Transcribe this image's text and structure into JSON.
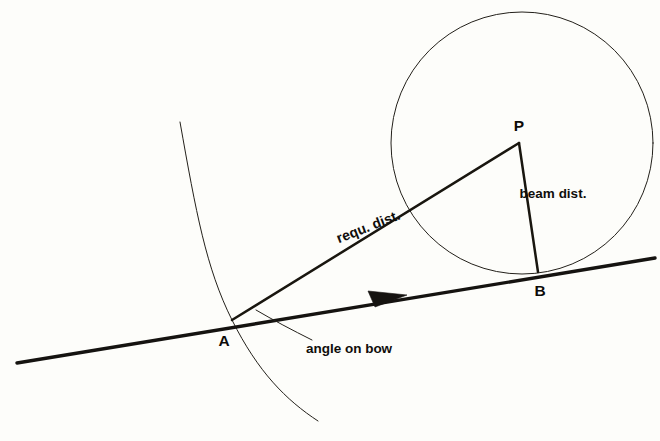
{
  "diagram": {
    "background_color": "#fdfdfa",
    "ink_color": "#151310",
    "points": [
      {
        "id": "A",
        "label": "A",
        "x": 232,
        "y": 320,
        "label_x": 222,
        "label_y": 344,
        "role": "own-ship position"
      },
      {
        "id": "B",
        "label": "B",
        "x": 538,
        "y": 272,
        "label_x": 538,
        "label_y": 295,
        "role": "beam point"
      },
      {
        "id": "P",
        "label": "P",
        "x": 519,
        "y": 143,
        "label_x": 519,
        "label_y": 129,
        "role": "target centre"
      }
    ],
    "labels": {
      "requ_dist": "requ. dist.",
      "beam_dist": "beam dist.",
      "angle_on_bow": "angle on bow"
    },
    "label_positions": {
      "requ_dist": {
        "x": 370,
        "y": 232,
        "rotation": -21.5
      },
      "beam_dist": {
        "x": 553,
        "y": 196,
        "rotation": 0
      },
      "angle_on_bow": {
        "x": 295,
        "y": 352,
        "rotation": 0
      }
    },
    "elements": [
      {
        "name": "bearing-line",
        "type": "line",
        "from": [
          17,
          363
        ],
        "to": [
          655,
          258
        ]
      },
      {
        "name": "direction-arrowhead",
        "type": "arrow",
        "tip": [
          407,
          296
        ]
      },
      {
        "name": "requ-dist-line",
        "type": "line",
        "from": [
          232,
          320
        ],
        "to": [
          519,
          143
        ]
      },
      {
        "name": "beam-dist-line",
        "type": "line",
        "from": [
          519,
          143
        ],
        "to": [
          538,
          272
        ]
      },
      {
        "name": "target-circle",
        "type": "circle",
        "center": [
          522,
          143
        ],
        "radius": 131
      },
      {
        "name": "course-arc",
        "type": "arc",
        "from": [
          180,
          122
        ],
        "through": [
          232,
          320
        ],
        "to": [
          318,
          421
        ]
      },
      {
        "name": "angle-leader",
        "type": "leader",
        "from": [
          258,
          312
        ],
        "to": [
          310,
          337
        ]
      }
    ]
  }
}
